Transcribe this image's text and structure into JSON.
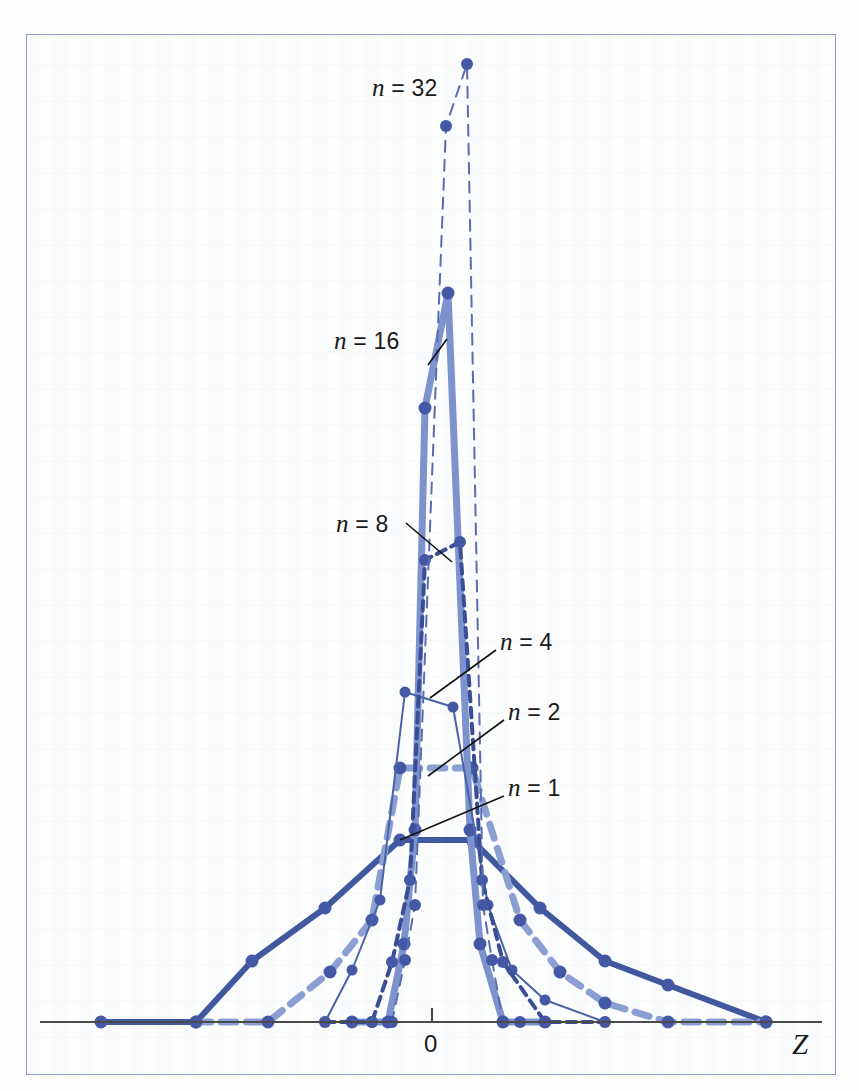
{
  "figure": {
    "kind": "sampling-distribution-of-the-mean",
    "frame_color": "#8f9fc4",
    "background": "#fdfefe"
  },
  "axis": {
    "zero_tick_label": "0",
    "variable_label": "Z",
    "axis_color": "#4a4a4a",
    "y_baseline_px": 1022,
    "x_left_px": 40,
    "x_right_px": 822,
    "zero_x_px": 432,
    "tick_top_px": 1008
  },
  "annotations": [
    {
      "name": "n-32",
      "text_italic": "n",
      "text_rest": " = 32",
      "x": 372,
      "y": 74,
      "leader": null
    },
    {
      "name": "n-16",
      "text_italic": "n",
      "text_rest": " = 16",
      "x": 334,
      "y": 327,
      "leader": {
        "x1": 447,
        "y1": 339,
        "x2": 428,
        "y2": 365
      }
    },
    {
      "name": "n-8",
      "text_italic": "n",
      "text_rest": " = 8",
      "x": 336,
      "y": 510,
      "leader": {
        "x1": 406,
        "y1": 523,
        "x2": 452,
        "y2": 562
      }
    },
    {
      "name": "n-4",
      "text_italic": "n",
      "text_rest": " = 4",
      "x": 500,
      "y": 628,
      "leader": {
        "x1": 496,
        "y1": 650,
        "x2": 430,
        "y2": 698
      }
    },
    {
      "name": "n-2",
      "text_italic": "n",
      "text_rest": " = 2",
      "x": 508,
      "y": 698,
      "leader": {
        "x1": 504,
        "y1": 720,
        "x2": 428,
        "y2": 776
      }
    },
    {
      "name": "n-1",
      "text_italic": "n",
      "text_rest": " = 1",
      "x": 508,
      "y": 774,
      "leader": {
        "x1": 504,
        "y1": 796,
        "x2": 400,
        "y2": 840
      }
    }
  ],
  "chart_data": {
    "type": "line",
    "title": "",
    "subtitle": "",
    "xlabel": "Z",
    "ylabel": "",
    "grid": false,
    "legend_position": "inline-annotations",
    "xlim": [
      -5.2,
      5.2
    ],
    "ylim": [
      0,
      1.0
    ],
    "note": "Sampling distributions of the standardized mean Z for increasing sample size n; peak height grows and spread shrinks as n increases.",
    "series": [
      {
        "name": "n = 1",
        "label": "n = 1",
        "n": 1,
        "color": "#41589e",
        "line_style": "solid",
        "line_width": 6,
        "marker": "circle",
        "marker_size": 13,
        "points_px": [
          [
            101,
            1022
          ],
          [
            196,
            1022
          ],
          [
            252,
            961
          ],
          [
            325,
            908
          ],
          [
            400,
            840
          ],
          [
            472,
            840
          ],
          [
            540,
            908
          ],
          [
            605,
            961
          ],
          [
            668,
            985
          ],
          [
            766,
            1022
          ]
        ],
        "x": [
          -4.6,
          -3.4,
          -2.7,
          -1.8,
          -0.85,
          0.05,
          0.85,
          1.7,
          2.5,
          3.75
        ],
        "y": [
          0.0,
          0.0,
          0.33,
          0.62,
          0.99,
          0.99,
          0.62,
          0.33,
          0.2,
          0.0
        ]
      },
      {
        "name": "n = 2",
        "label": "n = 2",
        "n": 2,
        "color": "#8c9fd2",
        "line_style": "dashed",
        "line_width": 7,
        "marker": "circle",
        "marker_size": 13,
        "points_px": [
          [
            196,
            1022
          ],
          [
            268,
            1022
          ],
          [
            330,
            972
          ],
          [
            372,
            920
          ],
          [
            400,
            768
          ],
          [
            472,
            768
          ],
          [
            520,
            920
          ],
          [
            560,
            972
          ],
          [
            605,
            1003
          ],
          [
            668,
            1022
          ],
          [
            766,
            1022
          ]
        ],
        "x": [
          -3.4,
          -2.7,
          -2.0,
          -1.45,
          -0.9,
          0.1,
          0.72,
          1.25,
          1.7,
          2.5,
          3.75
        ],
        "y": [
          0.0,
          0.0,
          0.27,
          0.55,
          1.37,
          1.37,
          0.55,
          0.27,
          0.1,
          0.0,
          0.0
        ]
      },
      {
        "name": "n = 4",
        "label": "n = 4",
        "n": 4,
        "color": "#4a63a8",
        "line_style": "solid",
        "line_width": 2,
        "marker": "circle",
        "marker_size": 11,
        "points_px": [
          [
            268,
            1022
          ],
          [
            325,
            1022
          ],
          [
            352,
            970
          ],
          [
            380,
            900
          ],
          [
            405,
            692
          ],
          [
            453,
            707
          ],
          [
            488,
            905
          ],
          [
            512,
            970
          ],
          [
            545,
            1000
          ],
          [
            605,
            1022
          ]
        ],
        "x": [
          -2.7,
          -2.0,
          -1.6,
          -1.2,
          -0.75,
          0.1,
          0.65,
          1.1,
          1.6,
          2.4
        ],
        "y": [
          0.0,
          0.0,
          0.28,
          0.65,
          1.77,
          1.69,
          0.62,
          0.27,
          0.12,
          0.0
        ]
      },
      {
        "name": "n = 8",
        "label": "n = 8",
        "n": 8,
        "color": "#3a4e96",
        "line_style": "dotted-dashed",
        "line_width": 4,
        "marker": "circle",
        "marker_size": 12,
        "points_px": [
          [
            325,
            1022
          ],
          [
            372,
            1022
          ],
          [
            392,
            962
          ],
          [
            410,
            880
          ],
          [
            425,
            560
          ],
          [
            460,
            542
          ],
          [
            482,
            880
          ],
          [
            503,
            962
          ],
          [
            545,
            1022
          ],
          [
            605,
            1022
          ]
        ],
        "x": [
          -2.0,
          -1.45,
          -1.2,
          -0.95,
          -0.55,
          0.15,
          0.6,
          0.95,
          1.55,
          2.4
        ],
        "y": [
          0.0,
          0.0,
          0.33,
          0.78,
          2.6,
          2.68,
          0.78,
          0.33,
          0.0,
          0.0
        ]
      },
      {
        "name": "n = 16",
        "label": "n = 16",
        "n": 16,
        "color": "#7e92cd",
        "line_style": "solid",
        "line_width": 7,
        "marker": "circle",
        "marker_size": 13,
        "points_px": [
          [
            352,
            1022
          ],
          [
            388,
            1022
          ],
          [
            404,
            944
          ],
          [
            415,
            830
          ],
          [
            425,
            408
          ],
          [
            448,
            293
          ],
          [
            470,
            830
          ],
          [
            480,
            944
          ],
          [
            503,
            1022
          ],
          [
            545,
            1022
          ]
        ],
        "x": [
          -1.6,
          -1.1,
          -0.9,
          -0.75,
          -0.55,
          0.05,
          0.55,
          0.75,
          1.1,
          1.55
        ],
        "y": [
          0.0,
          0.0,
          0.42,
          0.97,
          3.18,
          3.8,
          0.97,
          0.42,
          0.0,
          0.0
        ]
      },
      {
        "name": "n = 32",
        "label": "n = 32",
        "n": 32,
        "color": "#5a6cb0",
        "line_style": "dashed-thin",
        "line_width": 2,
        "marker": "circle",
        "marker_size": 12,
        "points_px": [
          [
            372,
            1022
          ],
          [
            392,
            1022
          ],
          [
            405,
            960
          ],
          [
            415,
            905
          ],
          [
            446,
            126
          ],
          [
            467,
            64
          ],
          [
            483,
            905
          ],
          [
            492,
            960
          ],
          [
            503,
            1022
          ],
          [
            520,
            1022
          ]
        ],
        "x": [
          -1.45,
          -1.2,
          -0.9,
          -0.72,
          -0.45,
          0.1,
          0.45,
          0.72,
          1.1,
          1.3
        ],
        "y": [
          0.0,
          0.0,
          0.34,
          0.64,
          4.98,
          5.33,
          0.64,
          0.34,
          0.0,
          0.0
        ]
      }
    ]
  }
}
